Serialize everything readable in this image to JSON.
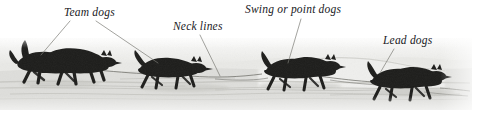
{
  "figure": {
    "kind": "annotated-photograph",
    "palette": {
      "page_background": "#ffffff",
      "snow_light": "#f4f4f2",
      "snow_mid": "#dcdcd8",
      "snow_shadow": "#b9b9b4",
      "dog_dark": "#1d1d1b",
      "dog_mid": "#3a3a37",
      "label_text": "#20201e",
      "leader_line": "#7b7b76",
      "towline": "#6e6e68"
    }
  },
  "annotations": [
    {
      "id": "team-dogs",
      "label": "Team dogs",
      "label_x": 64,
      "label_y": 7,
      "leaders": [
        {
          "x1": 70,
          "y1": 21,
          "x2": 41,
          "y2": 55
        },
        {
          "x1": 96,
          "y1": 21,
          "x2": 158,
          "y2": 63
        }
      ]
    },
    {
      "id": "neck-lines",
      "label": "Neck lines",
      "label_x": 173,
      "label_y": 21,
      "leaders": [
        {
          "x1": 200,
          "y1": 35,
          "x2": 220,
          "y2": 76
        }
      ]
    },
    {
      "id": "swing-or-point-dogs",
      "label": "Swing or point dogs",
      "label_x": 245,
      "label_y": 4,
      "leaders": [
        {
          "x1": 301,
          "y1": 19,
          "x2": 288,
          "y2": 63
        }
      ]
    },
    {
      "id": "lead-dogs",
      "label": "Lead dogs",
      "label_x": 383,
      "label_y": 35,
      "leaders": [
        {
          "x1": 394,
          "y1": 49,
          "x2": 380,
          "y2": 73
        }
      ]
    }
  ],
  "dog_groups": [
    {
      "id": "team-dogs-rear",
      "role": "Team dogs",
      "x": 8,
      "y": 44
    },
    {
      "id": "team-dogs-front",
      "role": "Team dogs",
      "x": 140,
      "y": 60
    },
    {
      "id": "swing-dogs",
      "role": "Swing or point dogs",
      "x": 262,
      "y": 58
    },
    {
      "id": "lead-dogs",
      "role": "Lead dogs",
      "x": 368,
      "y": 68
    }
  ]
}
